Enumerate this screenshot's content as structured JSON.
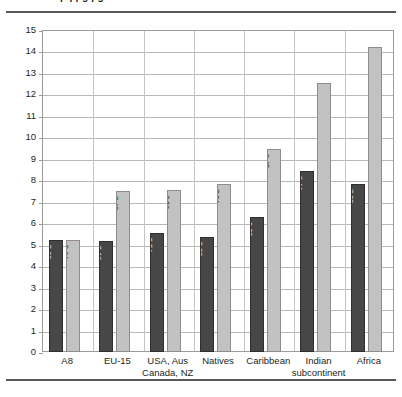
{
  "figure": {
    "cutoff_title": "pq  pg  pg",
    "rules": {
      "top": true,
      "bottom": true
    }
  },
  "chart_data": {
    "type": "bar",
    "title": "",
    "subtitle": "",
    "xlabel": "",
    "ylabel": "",
    "ylim": [
      0,
      15
    ],
    "ytick_step": 1,
    "grid": "horizontal-and-vertical",
    "legend_position": "none",
    "bar_label_rotation": 90,
    "categories": [
      "A8",
      "EU-15",
      "USA, Aus\nCanada, NZ",
      "Natives",
      "Caribbean",
      "Indian\nsubcontinent",
      "Africa"
    ],
    "category_lines": [
      [
        "A8"
      ],
      [
        "EU-15"
      ],
      [
        "USA, Aus",
        "Canada, NZ"
      ],
      [
        "Natives"
      ],
      [
        "Caribbean"
      ],
      [
        "Indian",
        "subcontinent"
      ],
      [
        "Africa"
      ]
    ],
    "yticks": [
      "0",
      "1",
      "2",
      "3",
      "4",
      "5",
      "6",
      "7",
      "8",
      "9",
      "10",
      "11",
      "12",
      "13",
      "14",
      "15"
    ],
    "series": [
      {
        "name": "series-dark",
        "color": "#474747",
        "values": [
          5.2,
          5.16,
          5.54,
          5.38,
          6.29,
          8.44,
          7.83
        ],
        "labels": [
          "5.20",
          "5.16",
          "5.54",
          "5.38",
          "6.29",
          "8.44",
          "7.83"
        ]
      },
      {
        "name": "series-light",
        "color": "#c2c2c2",
        "values": [
          5.24,
          7.48,
          7.56,
          7.84,
          9.45,
          12.53,
          14.23
        ],
        "labels": [
          "5.24",
          "7.48",
          "7.56",
          "7.84",
          "9.45",
          "12.53",
          "14.23"
        ]
      }
    ]
  }
}
